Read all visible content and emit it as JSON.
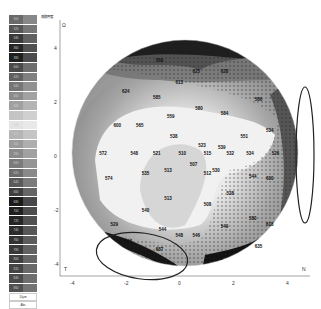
{
  "legend": {
    "title": "角膜厚度",
    "unit": "10µm",
    "mode": "Abs",
    "steps": [
      {
        "v": "300",
        "c": "#6a6a6a"
      },
      {
        "v": "320",
        "c": "#555555"
      },
      {
        "v": "340",
        "c": "#3a3a3a"
      },
      {
        "v": "360",
        "c": "#262626"
      },
      {
        "v": "380",
        "c": "#1f1f1f"
      },
      {
        "v": "400",
        "c": "#4a4a4a"
      },
      {
        "v": "420",
        "c": "#606060"
      },
      {
        "v": "440",
        "c": "#767676"
      },
      {
        "v": "460",
        "c": "#8b8b8b"
      },
      {
        "v": "480",
        "c": "#a1a1a1"
      },
      {
        "v": "500",
        "c": "#c4c4c4"
      },
      {
        "v": "520",
        "c": "#e3e3e3"
      },
      {
        "v": "540",
        "c": "#b5b5b5"
      },
      {
        "v": "560",
        "c": "#9a9a9a"
      },
      {
        "v": "580",
        "c": "#8a8a8a"
      },
      {
        "v": "600",
        "c": "#7b7b7b"
      },
      {
        "v": "620",
        "c": "#6c6c6c"
      },
      {
        "v": "640",
        "c": "#5a5a5a"
      },
      {
        "v": "660",
        "c": "#3e3e3e"
      },
      {
        "v": "680",
        "c": "#1a1a1a"
      },
      {
        "v": "700",
        "c": "#202020"
      },
      {
        "v": "720",
        "c": "#262626"
      },
      {
        "v": "740",
        "c": "#2d2d2d"
      },
      {
        "v": "760",
        "c": "#333333"
      },
      {
        "v": "780",
        "c": "#393939"
      },
      {
        "v": "800",
        "c": "#3f3f3f"
      },
      {
        "v": "820",
        "c": "#454545"
      },
      {
        "v": "840",
        "c": "#4b4b4b"
      },
      {
        "v": "860",
        "c": "#515151"
      }
    ]
  },
  "axes": {
    "corner_label": "Ω",
    "y_ticks": [
      "4",
      "2",
      "0",
      "-2",
      "-4"
    ],
    "x_ticks": [
      "-4",
      "-2",
      "0",
      "2",
      "4"
    ],
    "left_label": "T",
    "right_label": "N",
    "angle_labels": [
      "90",
      "120",
      "60",
      "150",
      "30",
      "180",
      "0",
      "210",
      "330",
      "240",
      "300",
      "270"
    ]
  },
  "chart_data": {
    "type": "heatmap",
    "xlabel": "",
    "ylabel": "",
    "xlim": [
      -4,
      4
    ],
    "ylim": [
      -4,
      4
    ],
    "left_label": "T",
    "right_label": "N",
    "unit": "µm",
    "points": [
      {
        "x": -0.9,
        "y": 3.3,
        "v": "569"
      },
      {
        "x": -0.2,
        "y": 2.5,
        "v": "613"
      },
      {
        "x": 0.4,
        "y": 2.9,
        "v": "625"
      },
      {
        "x": 1.4,
        "y": 2.9,
        "v": "628"
      },
      {
        "x": -2.1,
        "y": 2.2,
        "v": "624"
      },
      {
        "x": -1.0,
        "y": 2.0,
        "v": "585"
      },
      {
        "x": 0.5,
        "y": 1.6,
        "v": "580"
      },
      {
        "x": 2.6,
        "y": 1.9,
        "v": "586"
      },
      {
        "x": -2.4,
        "y": 1.0,
        "v": "600"
      },
      {
        "x": -1.6,
        "y": 1.0,
        "v": "565"
      },
      {
        "x": -0.5,
        "y": 1.3,
        "v": "559"
      },
      {
        "x": 1.4,
        "y": 1.4,
        "v": "584"
      },
      {
        "x": -0.4,
        "y": 0.6,
        "v": "538"
      },
      {
        "x": 0.6,
        "y": 0.3,
        "v": "523"
      },
      {
        "x": 1.3,
        "y": 0.2,
        "v": "539"
      },
      {
        "x": 2.1,
        "y": 0.6,
        "v": "551"
      },
      {
        "x": 3.0,
        "y": 0.8,
        "v": "534"
      },
      {
        "x": -2.9,
        "y": 0.0,
        "v": "572"
      },
      {
        "x": -1.8,
        "y": 0.0,
        "v": "548"
      },
      {
        "x": -1.0,
        "y": 0.0,
        "v": "521"
      },
      {
        "x": -0.1,
        "y": 0.0,
        "v": "510"
      },
      {
        "x": 0.8,
        "y": 0.0,
        "v": "515"
      },
      {
        "x": 1.6,
        "y": 0.0,
        "v": "532"
      },
      {
        "x": 2.3,
        "y": 0.0,
        "v": "534"
      },
      {
        "x": 3.2,
        "y": 0.0,
        "v": "526"
      },
      {
        "x": -2.7,
        "y": -0.9,
        "v": "574"
      },
      {
        "x": -1.4,
        "y": -0.7,
        "v": "535"
      },
      {
        "x": -0.6,
        "y": -0.6,
        "v": "513"
      },
      {
        "x": 0.3,
        "y": -0.4,
        "v": "507"
      },
      {
        "x": 1.1,
        "y": -0.6,
        "v": "530"
      },
      {
        "x": 0.8,
        "y": -0.7,
        "v": "512"
      },
      {
        "x": 2.4,
        "y": -0.8,
        "v": "544"
      },
      {
        "x": 3.0,
        "y": -0.9,
        "v": "600"
      },
      {
        "x": -0.6,
        "y": -1.6,
        "v": "513"
      },
      {
        "x": 0.8,
        "y": -1.8,
        "v": "508"
      },
      {
        "x": 1.6,
        "y": -1.4,
        "v": "538"
      },
      {
        "x": -1.4,
        "y": -2.0,
        "v": "540"
      },
      {
        "x": -2.5,
        "y": -2.5,
        "v": "529"
      },
      {
        "x": 2.4,
        "y": -2.3,
        "v": "580"
      },
      {
        "x": 3.0,
        "y": -2.5,
        "v": "618"
      },
      {
        "x": -0.8,
        "y": -2.7,
        "v": "544"
      },
      {
        "x": 1.4,
        "y": -2.6,
        "v": "549"
      },
      {
        "x": 0.4,
        "y": -2.9,
        "v": "546"
      },
      {
        "x": -0.2,
        "y": -2.9,
        "v": "548"
      },
      {
        "x": -2.0,
        "y": -3.1,
        "v": "606"
      },
      {
        "x": 2.6,
        "y": -3.3,
        "v": "635"
      },
      {
        "x": -0.9,
        "y": -3.4,
        "v": "687"
      },
      {
        "x": 1.2,
        "y": -3.7,
        "v": "591"
      }
    ],
    "annotations": [
      "ellipse nasal (right edge)",
      "ellipse inferotemporal (bottom left)"
    ]
  }
}
